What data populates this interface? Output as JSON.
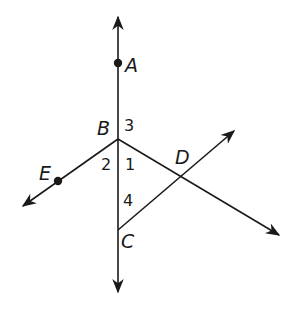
{
  "diagram": {
    "points": [
      {
        "name": "A",
        "x": 118,
        "y": 63,
        "dot": true
      },
      {
        "name": "B",
        "x": 118,
        "y": 139,
        "dot": false
      },
      {
        "name": "C",
        "x": 118,
        "y": 230,
        "dot": false
      },
      {
        "name": "D",
        "x": 181,
        "y": 177,
        "dot": false
      },
      {
        "name": "E",
        "x": 58,
        "y": 181,
        "dot": true
      }
    ],
    "labels": {
      "A": "A",
      "B": "B",
      "C": "C",
      "D": "D",
      "E": "E"
    },
    "angles": {
      "a1": "1",
      "a2": "2",
      "a3": "3",
      "a4": "4"
    },
    "lines": [
      {
        "name": "line-AC",
        "description": "vertical line through A, B, C",
        "from": [
          118,
          17
        ],
        "to": [
          118,
          292
        ]
      },
      {
        "name": "ray-BE",
        "description": "line from B through E",
        "from": [
          118,
          139
        ],
        "to": [
          23,
          206
        ]
      },
      {
        "name": "ray-BD",
        "description": "line from B through D",
        "from": [
          118,
          139
        ],
        "to": [
          279,
          235
        ]
      },
      {
        "name": "ray-CD",
        "description": "line from C through D",
        "from": [
          118,
          230
        ],
        "to": [
          234,
          131
        ]
      }
    ],
    "colors": {
      "stroke": "#1a1a1a",
      "background": "#ffffff"
    }
  }
}
